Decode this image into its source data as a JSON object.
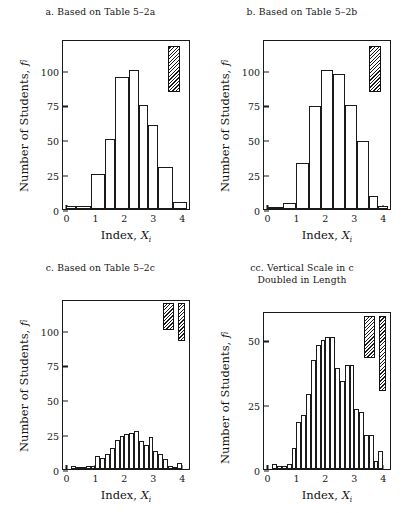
{
  "figure": {
    "width": 403,
    "height": 513,
    "background": "#ffffff",
    "ink_color": "#1a1a1a"
  },
  "common": {
    "ylabel": "Number of Students,",
    "ylabel_symbol": "f",
    "ylabel_subscript": "i",
    "xlabel": "Index,",
    "xlabel_symbol": "X",
    "xlabel_subscript": "i",
    "xticks": [
      "0",
      "1",
      "2",
      "3",
      "4"
    ],
    "xlim": [
      -0.12,
      4.3
    ]
  },
  "chart_data": [
    {
      "id": "panel-a",
      "type": "bar",
      "title": "a. Based on Table 5–2a",
      "xlabel": "Index, X_i",
      "ylabel": "Number of Students, f_i",
      "xlim": [
        -0.12,
        4.3
      ],
      "ylim": [
        0,
        122
      ],
      "yticks": [
        0,
        25,
        50,
        75,
        100
      ],
      "ytick_labels": [
        "0",
        "25",
        "50",
        "75",
        "100"
      ],
      "grid": false,
      "legend": "none",
      "bin_width": 0.5,
      "bin_edges": [
        0.0,
        0.33,
        0.83,
        1.33,
        1.67,
        2.17,
        2.5,
        2.83,
        3.17,
        3.67,
        4.17
      ],
      "bars": [
        {
          "left": 0.0,
          "right": 0.33,
          "value": 2
        },
        {
          "left": 0.33,
          "right": 0.83,
          "value": 2
        },
        {
          "left": 0.83,
          "right": 1.33,
          "value": 25
        },
        {
          "left": 1.33,
          "right": 1.67,
          "value": 50
        },
        {
          "left": 1.67,
          "right": 2.17,
          "value": 95
        },
        {
          "left": 2.17,
          "right": 2.5,
          "value": 100
        },
        {
          "left": 2.5,
          "right": 2.83,
          "value": 75
        },
        {
          "left": 2.83,
          "right": 3.17,
          "value": 60
        },
        {
          "left": 3.17,
          "right": 3.67,
          "value": 30
        },
        {
          "left": 3.67,
          "right": 4.17,
          "value": 5
        }
      ],
      "markers": [
        {
          "name": "bin-width-marker",
          "x_left": 3.52,
          "x_right": 3.92,
          "y_bottom": 84,
          "y_top": 117
        }
      ]
    },
    {
      "id": "panel-b",
      "type": "bar",
      "title": "b. Based on Table 5–2b",
      "xlabel": "Index, X_i",
      "ylabel": "Number of Students, f_i",
      "xlim": [
        -0.12,
        4.3
      ],
      "ylim": [
        0,
        122
      ],
      "yticks": [
        0,
        25,
        50,
        75,
        100
      ],
      "ytick_labels": [
        "0",
        "25",
        "50",
        "75",
        "100"
      ],
      "grid": false,
      "legend": "none",
      "bin_width": 0.45,
      "bin_edges": [
        0.0,
        0.33,
        0.72,
        1.0,
        1.42,
        1.85,
        2.25,
        2.67,
        3.08,
        3.5,
        3.83,
        4.17
      ],
      "bars": [
        {
          "left": 0.0,
          "right": 0.55,
          "value": 1
        },
        {
          "left": 0.55,
          "right": 1.0,
          "value": 4
        },
        {
          "left": 1.0,
          "right": 1.42,
          "value": 33
        },
        {
          "left": 1.42,
          "right": 1.85,
          "value": 74
        },
        {
          "left": 1.85,
          "right": 2.25,
          "value": 100
        },
        {
          "left": 2.25,
          "right": 2.67,
          "value": 97
        },
        {
          "left": 2.67,
          "right": 3.08,
          "value": 75
        },
        {
          "left": 3.08,
          "right": 3.5,
          "value": 49
        },
        {
          "left": 3.5,
          "right": 3.83,
          "value": 9
        },
        {
          "left": 3.83,
          "right": 4.17,
          "value": 2
        }
      ],
      "markers": [
        {
          "name": "bin-width-marker",
          "x_left": 3.5,
          "x_right": 3.93,
          "y_bottom": 84,
          "y_top": 117
        }
      ]
    },
    {
      "id": "panel-c",
      "type": "bar",
      "title": "c. Based on Table 5–2c",
      "xlabel": "Index, X_i",
      "ylabel": "Number of Students, f_i",
      "xlim": [
        -0.12,
        4.3
      ],
      "ylim": [
        0,
        122
      ],
      "yticks": [
        0,
        25,
        50,
        75,
        100
      ],
      "ytick_labels": [
        "0",
        "25",
        "50",
        "75",
        "100"
      ],
      "grid": false,
      "legend": "none",
      "bin_width": 0.167,
      "bars": [
        {
          "left": 0.0,
          "right": 0.167,
          "value": 0
        },
        {
          "left": 0.167,
          "right": 0.333,
          "value": 2
        },
        {
          "left": 0.333,
          "right": 0.5,
          "value": 1
        },
        {
          "left": 0.5,
          "right": 0.667,
          "value": 1
        },
        {
          "left": 0.667,
          "right": 0.833,
          "value": 2
        },
        {
          "left": 0.833,
          "right": 1.0,
          "value": 2
        },
        {
          "left": 1.0,
          "right": 1.167,
          "value": 9
        },
        {
          "left": 1.167,
          "right": 1.333,
          "value": 8
        },
        {
          "left": 1.333,
          "right": 1.5,
          "value": 11
        },
        {
          "left": 1.5,
          "right": 1.667,
          "value": 15
        },
        {
          "left": 1.667,
          "right": 1.833,
          "value": 21
        },
        {
          "left": 1.833,
          "right": 2.0,
          "value": 24
        },
        {
          "left": 2.0,
          "right": 2.167,
          "value": 25
        },
        {
          "left": 2.167,
          "right": 2.333,
          "value": 26
        },
        {
          "left": 2.333,
          "right": 2.5,
          "value": 27
        },
        {
          "left": 2.5,
          "right": 2.667,
          "value": 20
        },
        {
          "left": 2.667,
          "right": 2.833,
          "value": 17
        },
        {
          "left": 2.833,
          "right": 3.0,
          "value": 23
        },
        {
          "left": 3.0,
          "right": 3.167,
          "value": 13
        },
        {
          "left": 3.167,
          "right": 3.333,
          "value": 11
        },
        {
          "left": 3.333,
          "right": 3.5,
          "value": 7
        },
        {
          "left": 3.5,
          "right": 3.667,
          "value": 2
        },
        {
          "left": 3.667,
          "right": 3.833,
          "value": 1
        },
        {
          "left": 3.833,
          "right": 4.0,
          "value": 4
        }
      ],
      "markers": [
        {
          "name": "bin-width-marker",
          "x_left": 3.33,
          "x_right": 3.72,
          "y_bottom": 100,
          "y_top": 119
        },
        {
          "name": "bin-height-marker",
          "x_left": 3.86,
          "x_right": 4.08,
          "y_bottom": 92,
          "y_top": 119
        }
      ]
    },
    {
      "id": "panel-cc",
      "type": "bar",
      "title": "cc. Vertical Scale in c",
      "title_line2": "Doubled in Length",
      "xlabel": "Index, X_i",
      "ylabel": "Number of Students, f_i",
      "xlim": [
        -0.12,
        4.3
      ],
      "ylim": [
        0,
        61
      ],
      "yticks": [
        0,
        25,
        50
      ],
      "ytick_labels": [
        "0",
        "25",
        "50"
      ],
      "grid": false,
      "legend": "none",
      "bin_width": 0.167,
      "note": "Same counts as panel c, vertical axis scale doubled in length",
      "bars": [
        {
          "left": 0.0,
          "right": 0.167,
          "value": 0
        },
        {
          "left": 0.167,
          "right": 0.333,
          "value": 2
        },
        {
          "left": 0.333,
          "right": 0.5,
          "value": 1
        },
        {
          "left": 0.5,
          "right": 0.667,
          "value": 1
        },
        {
          "left": 0.667,
          "right": 0.833,
          "value": 2
        },
        {
          "left": 0.833,
          "right": 1.0,
          "value": 8
        },
        {
          "left": 1.0,
          "right": 1.167,
          "value": 18
        },
        {
          "left": 1.167,
          "right": 1.333,
          "value": 21
        },
        {
          "left": 1.333,
          "right": 1.5,
          "value": 29
        },
        {
          "left": 1.5,
          "right": 1.667,
          "value": 42
        },
        {
          "left": 1.667,
          "right": 1.833,
          "value": 48
        },
        {
          "left": 1.833,
          "right": 2.0,
          "value": 50
        },
        {
          "left": 2.0,
          "right": 2.167,
          "value": 51
        },
        {
          "left": 2.167,
          "right": 2.333,
          "value": 51
        },
        {
          "left": 2.333,
          "right": 2.5,
          "value": 39
        },
        {
          "left": 2.5,
          "right": 2.667,
          "value": 34
        },
        {
          "left": 2.667,
          "right": 2.833,
          "value": 40
        },
        {
          "left": 2.833,
          "right": 3.0,
          "value": 40
        },
        {
          "left": 3.0,
          "right": 3.167,
          "value": 23
        },
        {
          "left": 3.167,
          "right": 3.333,
          "value": 22
        },
        {
          "left": 3.333,
          "right": 3.5,
          "value": 13
        },
        {
          "left": 3.5,
          "right": 3.667,
          "value": 13
        },
        {
          "left": 3.667,
          "right": 3.833,
          "value": 3
        },
        {
          "left": 3.833,
          "right": 4.0,
          "value": 7
        }
      ],
      "markers": [
        {
          "name": "bin-width-marker",
          "x_left": 3.35,
          "x_right": 3.72,
          "y_bottom": 43,
          "y_top": 59
        },
        {
          "name": "bin-height-marker",
          "x_left": 3.86,
          "x_right": 4.08,
          "y_bottom": 30,
          "y_top": 59
        }
      ]
    }
  ]
}
